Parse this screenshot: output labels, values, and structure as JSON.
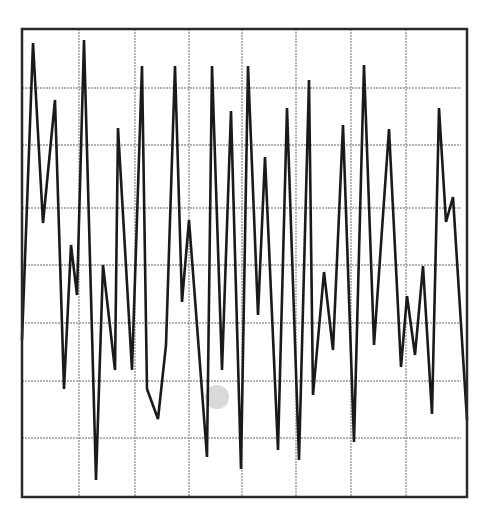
{
  "chart_data": {
    "type": "line",
    "title": "",
    "xlabel": "",
    "ylabel": "",
    "grid": true,
    "legend": null,
    "frame": {
      "x0": 22,
      "y0": 29,
      "x1": 467,
      "y1": 497
    },
    "grid_x": [
      79,
      135,
      189,
      242,
      296,
      351,
      406
    ],
    "grid_y": [
      88,
      145,
      208,
      265,
      323,
      381,
      438
    ],
    "xlim": [
      0,
      8
    ],
    "ylim": [
      0,
      8
    ],
    "series": [
      {
        "name": "signal",
        "color": "#1a1a1a",
        "points_px": [
          [
            22,
            340
          ],
          [
            33,
            43
          ],
          [
            43,
            223
          ],
          [
            55,
            100
          ],
          [
            64,
            389
          ],
          [
            71,
            245
          ],
          [
            77,
            295
          ],
          [
            84,
            40
          ],
          [
            96,
            480
          ],
          [
            103,
            265
          ],
          [
            115,
            370
          ],
          [
            118,
            128
          ],
          [
            132,
            370
          ],
          [
            142,
            66
          ],
          [
            147,
            389
          ],
          [
            158,
            419
          ],
          [
            166,
            345
          ],
          [
            175,
            66
          ],
          [
            182,
            302
          ],
          [
            189,
            220
          ],
          [
            207,
            457
          ],
          [
            212,
            66
          ],
          [
            222,
            370
          ],
          [
            231,
            111
          ],
          [
            241,
            469
          ],
          [
            248,
            66
          ],
          [
            258,
            315
          ],
          [
            265,
            157
          ],
          [
            278,
            450
          ],
          [
            287,
            108
          ],
          [
            299,
            460
          ],
          [
            309,
            80
          ],
          [
            313,
            395
          ],
          [
            324,
            272
          ],
          [
            333,
            350
          ],
          [
            343,
            125
          ],
          [
            354,
            442
          ],
          [
            364,
            65
          ],
          [
            374,
            345
          ],
          [
            389,
            129
          ],
          [
            401,
            367
          ],
          [
            407,
            296
          ],
          [
            415,
            355
          ],
          [
            423,
            266
          ],
          [
            432,
            414
          ],
          [
            439,
            108
          ],
          [
            446,
            222
          ],
          [
            453,
            197
          ],
          [
            467,
            420
          ]
        ]
      }
    ],
    "annotations": [
      {
        "type": "smudge",
        "x": 217,
        "y": 397,
        "r": 12,
        "color": "#cfcfcf"
      }
    ]
  },
  "colors": {
    "background": "#ffffff",
    "frame": "#2a2a2a",
    "grid": "#9a9a9a",
    "line": "#1a1a1a"
  },
  "caption": "Oscilloscope-style line trace on grid"
}
